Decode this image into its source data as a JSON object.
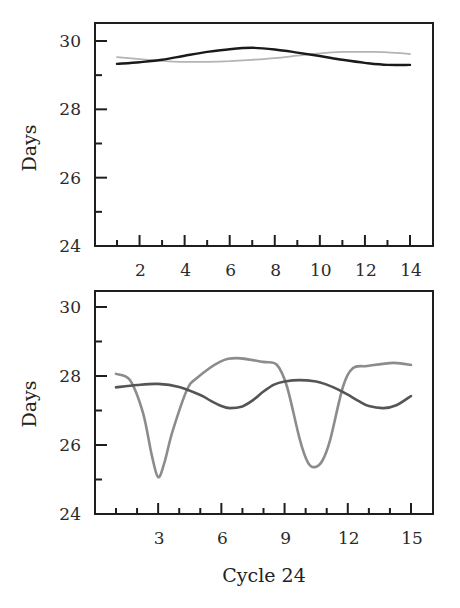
{
  "chart_data": [
    {
      "type": "line",
      "title": "",
      "xlabel": "",
      "ylabel": "Days",
      "xlim": [
        0,
        14.9
      ],
      "ylim": [
        24,
        30.5
      ],
      "xticks": [
        2,
        4,
        6,
        8,
        10,
        12,
        14
      ],
      "xticks_minor": [
        1,
        3,
        5,
        7,
        9,
        11,
        13
      ],
      "yticks": [
        24,
        26,
        28,
        30
      ],
      "yticks_minor": [
        25,
        27,
        29
      ],
      "grid": false,
      "legend": null,
      "series": [
        {
          "name": "series-dark",
          "color": "#1a1a1a",
          "x": [
            1,
            2,
            3,
            4,
            5,
            6,
            7,
            8,
            9,
            10,
            11,
            12,
            13,
            14
          ],
          "y": [
            29.33,
            29.38,
            29.45,
            29.57,
            29.68,
            29.76,
            29.8,
            29.75,
            29.66,
            29.56,
            29.45,
            29.36,
            29.3,
            29.3
          ]
        },
        {
          "name": "series-light",
          "color": "#b4b4b4",
          "x": [
            1,
            2,
            3,
            4,
            5,
            6,
            7,
            8,
            9,
            10,
            11,
            12,
            13,
            14
          ],
          "y": [
            29.53,
            29.47,
            29.42,
            29.39,
            29.39,
            29.41,
            29.45,
            29.5,
            29.57,
            29.64,
            29.68,
            29.68,
            29.67,
            29.62
          ]
        }
      ]
    },
    {
      "type": "line",
      "title": "",
      "xlabel": "Cycle 24",
      "ylabel": "Days",
      "xlim": [
        0,
        16.0
      ],
      "ylim": [
        24,
        30.5
      ],
      "xticks": [
        3,
        6,
        9,
        12,
        15
      ],
      "xticks_minor": [
        1,
        2,
        4,
        5,
        7,
        8,
        10,
        11,
        13,
        14
      ],
      "yticks": [
        24,
        26,
        28,
        30
      ],
      "yticks_minor": [
        25,
        27,
        29
      ],
      "grid": false,
      "legend": null,
      "series": [
        {
          "name": "series-dark",
          "color": "#555555",
          "x": [
            1,
            2,
            3,
            4,
            5,
            5.5,
            6,
            6.4,
            7,
            7.5,
            8,
            8.5,
            9,
            9.7,
            10.5,
            11,
            11.5,
            12,
            12.5,
            13,
            13.7,
            14.3,
            15
          ],
          "y": [
            27.67,
            27.74,
            27.77,
            27.68,
            27.45,
            27.28,
            27.13,
            27.07,
            27.12,
            27.3,
            27.55,
            27.75,
            27.84,
            27.88,
            27.84,
            27.75,
            27.62,
            27.46,
            27.28,
            27.13,
            27.07,
            27.15,
            27.42
          ]
        },
        {
          "name": "series-light",
          "color": "#8c8c8c",
          "x": [
            1,
            1.66,
            2.28,
            2.7,
            3.0,
            3.3,
            3.7,
            4.37,
            4.84,
            5.93,
            6.74,
            7.98,
            8.64,
            9.12,
            9.73,
            10.1,
            10.44,
            10.8,
            11.16,
            11.77,
            12.25,
            12.91,
            14.15,
            15
          ],
          "y": [
            28.06,
            27.88,
            26.93,
            25.7,
            25.07,
            25.5,
            26.43,
            27.6,
            27.94,
            28.41,
            28.52,
            28.41,
            28.32,
            27.68,
            26.14,
            25.5,
            25.36,
            25.55,
            26.14,
            27.68,
            28.23,
            28.29,
            28.38,
            28.32
          ]
        }
      ]
    }
  ],
  "panels": [
    {
      "frame": {
        "left": 95,
        "top": 23,
        "right": 433,
        "bottom": 246
      },
      "x_map": {
        "v0": 1,
        "p0": 117,
        "v1": 14,
        "p1": 410
      },
      "y_map": {
        "v0": 30,
        "p0": 41,
        "v1": 24,
        "p1": 246
      },
      "ylabel_pos": {
        "x": 36,
        "y": 148
      },
      "xlabel_pos": null
    },
    {
      "frame": {
        "left": 95,
        "top": 291,
        "right": 433,
        "bottom": 514
      },
      "x_map": {
        "v0": 1,
        "p0": 116,
        "v1": 15,
        "p1": 411
      },
      "y_map": {
        "v0": 30,
        "p0": 307,
        "v1": 24,
        "p1": 514
      },
      "ylabel_pos": {
        "x": 36,
        "y": 404
      },
      "xlabel_pos": {
        "x": 264,
        "y": 582
      }
    }
  ],
  "style": {
    "axis_color": "#1e1e1e"
  }
}
